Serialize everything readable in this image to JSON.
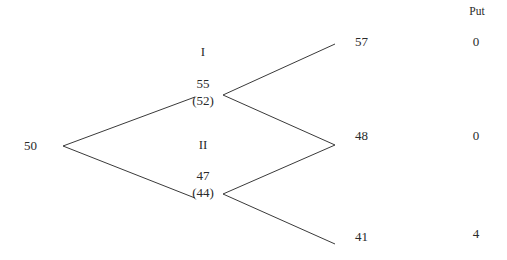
{
  "diagram": {
    "type": "binomial-tree",
    "column_header": "Put",
    "root": {
      "value": "50"
    },
    "intermediate_nodes": [
      {
        "label": "I",
        "price": "55",
        "adjusted": "(52)"
      },
      {
        "label": "II",
        "price": "47",
        "adjusted": "(44)"
      }
    ],
    "terminal_nodes": [
      {
        "price": "57",
        "put": "0"
      },
      {
        "price": "48",
        "put": "0"
      },
      {
        "price": "41",
        "put": "4"
      }
    ],
    "edges": [
      {
        "from": "50",
        "to": "55"
      },
      {
        "from": "50",
        "to": "47"
      },
      {
        "from": "55",
        "to": "57"
      },
      {
        "from": "55",
        "to": "48"
      },
      {
        "from": "47",
        "to": "48"
      },
      {
        "from": "47",
        "to": "41"
      }
    ]
  }
}
